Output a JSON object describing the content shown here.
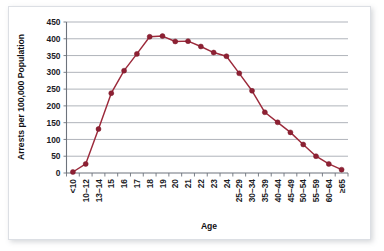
{
  "figure": {
    "background_color": "#ffffff",
    "border_color": "#dcdfe4"
  },
  "chart_data": {
    "type": "line",
    "title": "",
    "xlabel": "Age",
    "ylabel": "Arrests per 100,000 Population",
    "ylim": [
      0,
      450
    ],
    "yticks": [
      0,
      50,
      100,
      150,
      200,
      250,
      300,
      350,
      400,
      450
    ],
    "ytick_labels": [
      "0",
      "50",
      "100",
      "150",
      "200",
      "250",
      "300",
      "350",
      "400",
      "450"
    ],
    "grid": "horizontal",
    "legend": "none",
    "line_color": "#9c2a3b",
    "marker_color": "#8e2033",
    "categories": [
      "<10",
      "10–12",
      "13–14",
      "15",
      "16",
      "17",
      "18",
      "19",
      "20",
      "21",
      "22",
      "23",
      "24",
      "25–29",
      "30–34",
      "35–39",
      "40–44",
      "45–49",
      "50–54",
      "55–59",
      "60–64",
      "≥65"
    ],
    "values": [
      3,
      27,
      131,
      238,
      305,
      355,
      406,
      408,
      392,
      393,
      377,
      359,
      348,
      297,
      245,
      181,
      151,
      121,
      85,
      50,
      27,
      10
    ]
  }
}
